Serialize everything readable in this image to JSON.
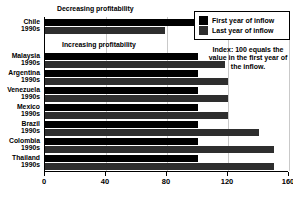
{
  "chart_data": {
    "type": "bar",
    "orientation": "horizontal",
    "title": "",
    "xlabel": "",
    "ylabel": "",
    "xlim": [
      0,
      160
    ],
    "xticks": [
      0,
      40,
      80,
      120,
      160
    ],
    "grid": true,
    "legend_position": "top-right",
    "categories": [
      {
        "name": "Chile",
        "decade": "1990s"
      },
      {
        "name": "Malaysia",
        "decade": "1990s"
      },
      {
        "name": "Argentina",
        "decade": "1990s"
      },
      {
        "name": "Venezuela",
        "decade": "1990s"
      },
      {
        "name": "Mexico",
        "decade": "1990s"
      },
      {
        "name": "Brazil",
        "decade": "1990s"
      },
      {
        "name": "Colombia",
        "decade": "1990s"
      },
      {
        "name": "Thailand",
        "decade": "1990s"
      }
    ],
    "series": [
      {
        "name": "First year of inflow",
        "color": "#000000",
        "values": [
          100,
          100,
          100,
          100,
          100,
          100,
          100,
          100
        ]
      },
      {
        "name": "Last year of inflow",
        "color": "#2e2e2e",
        "values": [
          79,
          118,
          120,
          120,
          120,
          140,
          150,
          150
        ]
      }
    ],
    "annotations": [
      {
        "id": "decreasing",
        "text": "Decreasing profitability"
      },
      {
        "id": "increasing",
        "text": "Increasing profitability"
      },
      {
        "id": "index-note",
        "text": "Index: 100 equals the value in the first year of the inflow."
      }
    ]
  },
  "legend": {
    "items": [
      {
        "label": "First year of inflow",
        "color": "#000000"
      },
      {
        "label": "Last year of inflow",
        "color": "#2e2e2e"
      }
    ]
  },
  "note": {
    "text": "Index: 100 equals the value in the first year of the inflow."
  },
  "annotations": {
    "decreasing": "Decreasing profitability",
    "increasing": "Increasing profitability"
  }
}
